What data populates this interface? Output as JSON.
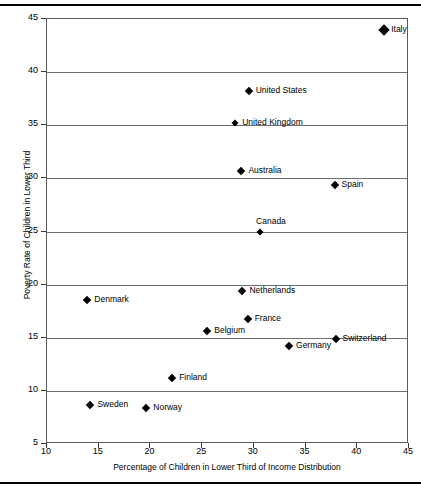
{
  "chart_data": {
    "type": "scatter",
    "title": "",
    "xlabel": "Percentage of Children in Lower Third of Income Distribution",
    "ylabel": "Poverty Rate of Children in Lower Third",
    "xlim": [
      10,
      45
    ],
    "ylim": [
      5,
      45
    ],
    "xticks": [
      10,
      15,
      20,
      25,
      30,
      35,
      40,
      45
    ],
    "yticks": [
      5,
      10,
      15,
      20,
      25,
      30,
      35,
      40,
      45
    ],
    "grid": "horizontal",
    "legend": "none",
    "marker": "diamond",
    "marker_color": "#000000",
    "points": [
      {
        "label": "Italy",
        "x": 42.6,
        "y": 44.0,
        "size": "lg",
        "label_pos": "right"
      },
      {
        "label": "United States",
        "x": 29.5,
        "y": 38.2,
        "size": "md",
        "label_pos": "right"
      },
      {
        "label": "United Kingdom",
        "x": 28.2,
        "y": 35.2,
        "size": "sm",
        "label_pos": "right"
      },
      {
        "label": "Australia",
        "x": 28.8,
        "y": 30.7,
        "size": "md",
        "label_pos": "right"
      },
      {
        "label": "Spain",
        "x": 37.8,
        "y": 29.4,
        "size": "md",
        "label_pos": "right"
      },
      {
        "label": "Canada",
        "x": 30.6,
        "y": 25.0,
        "size": "sm",
        "label_pos": "above"
      },
      {
        "label": "Netherlands",
        "x": 28.9,
        "y": 19.4,
        "size": "md",
        "label_pos": "right"
      },
      {
        "label": "Denmark",
        "x": 13.9,
        "y": 18.6,
        "size": "md",
        "label_pos": "right"
      },
      {
        "label": "France",
        "x": 29.4,
        "y": 16.8,
        "size": "md",
        "label_pos": "right"
      },
      {
        "label": "Belgium",
        "x": 25.5,
        "y": 15.6,
        "size": "md",
        "label_pos": "right"
      },
      {
        "label": "Switzerland",
        "x": 37.9,
        "y": 14.9,
        "size": "md",
        "label_pos": "right"
      },
      {
        "label": "Germany",
        "x": 33.4,
        "y": 14.2,
        "size": "md",
        "label_pos": "right"
      },
      {
        "label": "Finland",
        "x": 22.1,
        "y": 11.2,
        "size": "md",
        "label_pos": "right"
      },
      {
        "label": "Sweden",
        "x": 14.2,
        "y": 8.7,
        "size": "md",
        "label_pos": "right"
      },
      {
        "label": "Norway",
        "x": 19.6,
        "y": 8.4,
        "size": "md",
        "label_pos": "right"
      }
    ]
  }
}
